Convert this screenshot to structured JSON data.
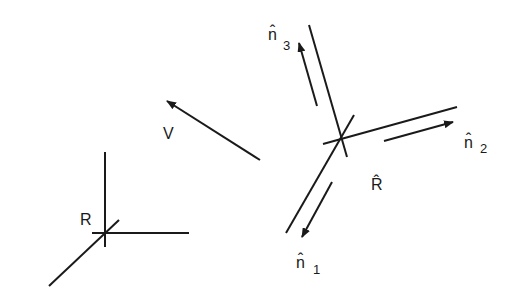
{
  "diagram": {
    "labels": {
      "origin_frame": "R",
      "velocity": "V",
      "rotated_frame": "R̂",
      "n1": {
        "base": "n̂",
        "sub": "1"
      },
      "n2": {
        "base": "n̂",
        "sub": "2"
      },
      "n3": {
        "base": "n̂",
        "sub": "3"
      }
    },
    "colors": {
      "stroke": "#1a1a1a",
      "background": "#ffffff"
    }
  }
}
